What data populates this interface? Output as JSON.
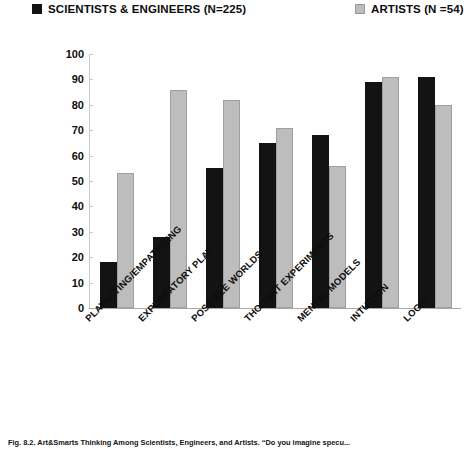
{
  "legend": {
    "position": "top",
    "entries": [
      {
        "label": "SCIENTISTS & ENGINEERS (N=225)",
        "color": "#131313",
        "swatch": "dark"
      },
      {
        "label": "ARTISTS (N =54)",
        "color": "#bdbdbd",
        "swatch": "light"
      }
    ]
  },
  "axis": {
    "y_ticks": [
      "100",
      "90",
      "80",
      "70",
      "60",
      "50",
      "40",
      "30",
      "20",
      "10",
      "0"
    ]
  },
  "caption": {
    "text": "Fig. 8.2.   Art&Smarts Thinking Among Scientists, Engineers, and Artists. “Do you imagine specu..."
  },
  "chart_data": {
    "type": "bar",
    "title": "",
    "subtitle": "",
    "xlabel": "",
    "ylabel": "",
    "ylim": [
      0,
      100
    ],
    "ytick_step": 10,
    "grid": false,
    "legend_position": "top",
    "categories": [
      "PLAYACTING/EMPATHIZING",
      "EXPLORATORY PLAY",
      "POSSIBLE WORLDS",
      "THOUGHT EXPERIMENTS",
      "MENTAL MODELS",
      "INTUITION",
      "LOGIC"
    ],
    "series": [
      {
        "name": "SCIENTISTS & ENGINEERS (N=225)",
        "color": "#131313",
        "values": [
          18,
          28,
          55,
          65,
          68,
          89,
          91
        ]
      },
      {
        "name": "ARTISTS (N =54)",
        "color": "#bdbdbd",
        "values": [
          53,
          86,
          82,
          71,
          56,
          91,
          80
        ]
      }
    ]
  }
}
